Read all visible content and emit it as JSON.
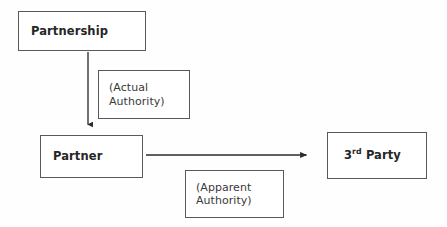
{
  "diagram": {
    "background_color": "#fefefe",
    "border_color": "#595959",
    "text_color": "#262626",
    "edge_color": "#2b2b2b",
    "nodes": {
      "partnership": {
        "label": "Partnership",
        "style": "entity"
      },
      "partner": {
        "label": "Partner",
        "style": "entity"
      },
      "third_party": {
        "label": "3rd Party",
        "number": "3",
        "ordinal_suffix": "rd",
        "noun": "Party",
        "style": "entity"
      },
      "actual_authority": {
        "label": "(Actual\nAuthority)",
        "style": "annotation"
      },
      "apparent_authority": {
        "label": "(Apparent\nAuthority)",
        "style": "annotation"
      }
    },
    "edges": [
      {
        "id": "partnership-to-partner",
        "from": "partnership",
        "to": "partner",
        "direction": "down",
        "annotation": "actual_authority"
      },
      {
        "id": "partner-to-third-party",
        "from": "partner",
        "to": "third_party",
        "direction": "right",
        "annotation": "apparent_authority"
      }
    ]
  }
}
